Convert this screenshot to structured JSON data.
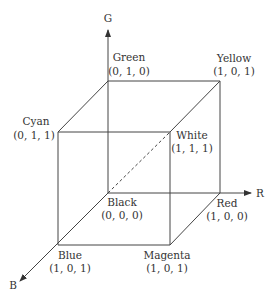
{
  "diagram": {
    "axes": [
      {
        "id": "R",
        "label": "R"
      },
      {
        "id": "G",
        "label": "G"
      },
      {
        "id": "B",
        "label": "B"
      }
    ],
    "vertices": [
      {
        "id": "black",
        "name": "Black",
        "coords": "(0, 0, 0)"
      },
      {
        "id": "green",
        "name": "Green",
        "coords": "(0, 1, 0)"
      },
      {
        "id": "cyan",
        "name": "Cyan",
        "coords": "(0, 1, 1)"
      },
      {
        "id": "yellow",
        "name": "Yellow",
        "coords": "(1, 0, 1)"
      },
      {
        "id": "white",
        "name": "White",
        "coords": "(1, 1, 1)"
      },
      {
        "id": "red",
        "name": "Red",
        "coords": "(1, 0, 0)"
      },
      {
        "id": "blue",
        "name": "Blue",
        "coords": "(1, 0, 1)"
      },
      {
        "id": "magenta",
        "name": "Magenta",
        "coords": "(1, 0, 1)"
      }
    ],
    "hidden_edge": "Black to White (dashed diagonal)"
  }
}
